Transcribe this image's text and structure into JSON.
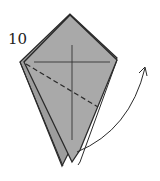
{
  "diagram": {
    "step_number": "10",
    "colors": {
      "paper": "#a9a9a9",
      "outline": "#2a2a2a",
      "background": "#ffffff"
    },
    "elements": [
      "folded-kite-shape",
      "crease-horizontal",
      "crease-vertical",
      "valley-fold-dashed-line",
      "curved-arrow"
    ]
  }
}
